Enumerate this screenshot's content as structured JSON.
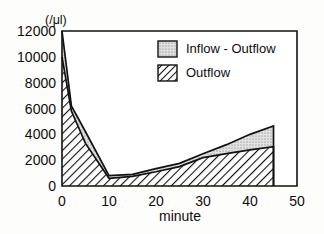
{
  "chart_data": {
    "type": "area",
    "title": "",
    "subtitle": "",
    "xlabel": "minute",
    "ylabel": "",
    "yunit": "(/μl)",
    "xlim": [
      0,
      50
    ],
    "ylim": [
      0,
      12000
    ],
    "xticks": [
      0,
      10,
      20,
      30,
      40,
      50
    ],
    "yticks": [
      0,
      2000,
      4000,
      6000,
      8000,
      10000,
      12000
    ],
    "xtick_labels": [
      "0",
      "10",
      "20",
      "30",
      "40",
      "50"
    ],
    "ytick_labels": [
      "0",
      "2000",
      "4000",
      "6000",
      "8000",
      "10000",
      "12000"
    ],
    "grid": false,
    "legend_position": "top-right",
    "stacked": true,
    "x": [
      0,
      2,
      5,
      10,
      15,
      20,
      25,
      30,
      35,
      40,
      45
    ],
    "series": [
      {
        "name": "Outflow",
        "pattern": "diagonal-hatch",
        "values": [
          10000,
          5800,
          3300,
          600,
          750,
          1100,
          1500,
          2200,
          2500,
          2800,
          3050
        ]
      },
      {
        "name": "Inflow - Outflow",
        "pattern": "stipple",
        "values": [
          2000,
          400,
          900,
          200,
          150,
          250,
          250,
          300,
          700,
          1200,
          1600
        ]
      }
    ],
    "total": {
      "name": "Inflow",
      "values": [
        12000,
        6200,
        4200,
        800,
        900,
        1350,
        1750,
        2500,
        3200,
        4000,
        4650
      ]
    }
  },
  "legend": {
    "entries": [
      {
        "label": "Inflow - Outflow",
        "pattern": "stipple"
      },
      {
        "label": "Outflow",
        "pattern": "diagonal-hatch"
      }
    ]
  },
  "colors": {
    "axis": "#111111",
    "outflow_fill": "#ffffff",
    "inflow_fill": "#d9d9d9",
    "background": "#fdfdfc"
  }
}
